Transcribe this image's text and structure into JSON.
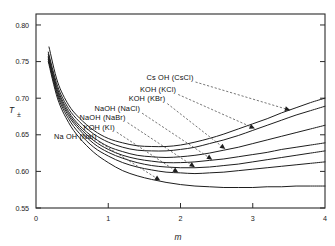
{
  "chart_data": {
    "type": "line",
    "title": "",
    "xlabel": "m",
    "ylabel": "T",
    "ylabel_subscript": "±",
    "xlim": [
      0,
      4
    ],
    "ylim": [
      0.55,
      0.815
    ],
    "xticks": [
      0,
      1,
      2,
      3,
      4
    ],
    "xticklabels": [
      "0",
      "1",
      "2",
      "3",
      "4"
    ],
    "yticks": [
      0.55,
      0.6,
      0.65,
      0.7,
      0.75,
      0.8
    ],
    "yticklabels": [
      "0.55",
      "0.60",
      "0.65",
      "0.70",
      "0.75",
      "0.80"
    ],
    "grid": false,
    "legend_position": "inline-annotations",
    "series": [
      {
        "name": "Cs OH (CsCl)",
        "label": "Cs OH (CsCl)",
        "x": [
          0.18,
          0.3,
          0.45,
          0.6,
          0.8,
          1.0,
          1.2,
          1.4,
          1.6,
          1.8,
          2.0,
          2.2,
          2.4,
          2.6,
          2.8,
          3.0,
          3.2,
          3.4,
          3.6,
          3.8,
          4.0
        ],
        "y": [
          0.77,
          0.722,
          0.691,
          0.673,
          0.656,
          0.645,
          0.639,
          0.635,
          0.634,
          0.634,
          0.636,
          0.64,
          0.645,
          0.651,
          0.658,
          0.665,
          0.672,
          0.68,
          0.687,
          0.694,
          0.7
        ]
      },
      {
        "name": "KOH (KCl)",
        "label": "KOH (KCl)",
        "x": [
          0.17,
          0.3,
          0.45,
          0.6,
          0.8,
          1.0,
          1.2,
          1.4,
          1.6,
          1.8,
          2.0,
          2.2,
          2.4,
          2.6,
          2.8,
          3.0,
          3.2,
          3.4,
          3.6,
          3.8,
          4.0
        ],
        "y": [
          0.763,
          0.716,
          0.686,
          0.668,
          0.651,
          0.64,
          0.633,
          0.629,
          0.628,
          0.628,
          0.63,
          0.633,
          0.638,
          0.643,
          0.649,
          0.656,
          0.663,
          0.67,
          0.677,
          0.683,
          0.689
        ]
      },
      {
        "name": "KOH (KBr)",
        "label": "KOH (KBr)",
        "x": [
          0.17,
          0.3,
          0.45,
          0.6,
          0.8,
          1.0,
          1.2,
          1.4,
          1.6,
          1.8,
          2.0,
          2.2,
          2.4,
          2.6,
          2.8,
          3.0,
          3.2,
          3.4,
          3.6,
          3.8,
          4.0
        ],
        "y": [
          0.76,
          0.712,
          0.682,
          0.663,
          0.646,
          0.634,
          0.627,
          0.622,
          0.62,
          0.619,
          0.62,
          0.622,
          0.625,
          0.629,
          0.633,
          0.638,
          0.643,
          0.648,
          0.653,
          0.658,
          0.663
        ]
      },
      {
        "name": "NaOH (NaCl)",
        "label": "NaOH (NaCl)",
        "x": [
          0.17,
          0.3,
          0.45,
          0.6,
          0.8,
          1.0,
          1.2,
          1.4,
          1.6,
          1.8,
          2.0,
          2.2,
          2.4,
          2.6,
          2.8,
          3.0,
          3.2,
          3.4,
          3.6,
          3.8,
          4.0
        ],
        "y": [
          0.757,
          0.709,
          0.679,
          0.66,
          0.642,
          0.63,
          0.622,
          0.617,
          0.614,
          0.612,
          0.612,
          0.613,
          0.615,
          0.617,
          0.62,
          0.623,
          0.626,
          0.63,
          0.633,
          0.636,
          0.639
        ]
      },
      {
        "name": "NaOH (NaBr)",
        "label": "NaOH (NaBr)",
        "x": [
          0.17,
          0.3,
          0.45,
          0.6,
          0.8,
          1.0,
          1.2,
          1.4,
          1.6,
          1.8,
          2.0,
          2.2,
          2.4,
          2.6,
          2.8,
          3.0,
          3.2,
          3.4,
          3.6,
          3.8,
          4.0
        ],
        "y": [
          0.755,
          0.706,
          0.676,
          0.657,
          0.638,
          0.626,
          0.618,
          0.612,
          0.608,
          0.606,
          0.605,
          0.605,
          0.606,
          0.608,
          0.61,
          0.613,
          0.616,
          0.619,
          0.622,
          0.625,
          0.628
        ]
      },
      {
        "name": "KOH (KI)",
        "label": "KOH (KI)",
        "x": [
          0.17,
          0.3,
          0.45,
          0.6,
          0.8,
          1.0,
          1.2,
          1.4,
          1.6,
          1.8,
          2.0,
          2.2,
          2.4,
          2.6,
          2.8,
          3.0,
          3.2,
          3.4,
          3.6,
          3.8,
          4.0
        ],
        "y": [
          0.753,
          0.703,
          0.672,
          0.652,
          0.633,
          0.621,
          0.612,
          0.606,
          0.602,
          0.599,
          0.598,
          0.597,
          0.598,
          0.599,
          0.601,
          0.603,
          0.605,
          0.607,
          0.609,
          0.611,
          0.613
        ]
      },
      {
        "name": "Na OH (NaI)",
        "label": "Na OH (NaI)",
        "x": [
          0.17,
          0.3,
          0.45,
          0.6,
          0.8,
          1.0,
          1.2,
          1.4,
          1.6,
          1.8,
          2.0,
          2.2,
          2.4,
          2.6,
          2.8,
          3.0,
          3.2,
          3.4,
          3.6,
          3.8,
          4.0
        ],
        "y": [
          0.75,
          0.699,
          0.667,
          0.646,
          0.626,
          0.612,
          0.601,
          0.594,
          0.589,
          0.585,
          0.582,
          0.58,
          0.579,
          0.578,
          0.578,
          0.578,
          0.579,
          0.579,
          0.58,
          0.58,
          0.58
        ]
      }
    ],
    "annotations": [
      {
        "text": "Cs OH (CsCl)",
        "label_x": 2.18,
        "label_y": 0.7255,
        "anchor": "start",
        "target_x": 3.52,
        "target_y": 0.6835
      },
      {
        "text": "KOH (KCl)",
        "label_x": 1.94,
        "label_y": 0.7085,
        "anchor": "start",
        "target_x": 3.03,
        "target_y": 0.6585
      },
      {
        "text": "KOH (KBr)",
        "label_x": 1.79,
        "label_y": 0.696,
        "anchor": "start",
        "target_x": 2.62,
        "target_y": 0.6305
      },
      {
        "text": "NaOH (NaCl)",
        "label_x": 1.44,
        "label_y": 0.683,
        "anchor": "start",
        "target_x": 2.44,
        "target_y": 0.616
      },
      {
        "text": "NaOH (NaBr)",
        "label_x": 1.24,
        "label_y": 0.67,
        "anchor": "start",
        "target_x": 2.2,
        "target_y": 0.6058
      },
      {
        "text": "KOH (KI)",
        "label_x": 1.09,
        "label_y": 0.657,
        "anchor": "start",
        "target_x": 1.97,
        "target_y": 0.5985
      },
      {
        "text": "Na OH (NaI)",
        "label_x": 0.84,
        "label_y": 0.644,
        "anchor": "start",
        "target_x": 1.72,
        "target_y": 0.5875
      }
    ]
  }
}
